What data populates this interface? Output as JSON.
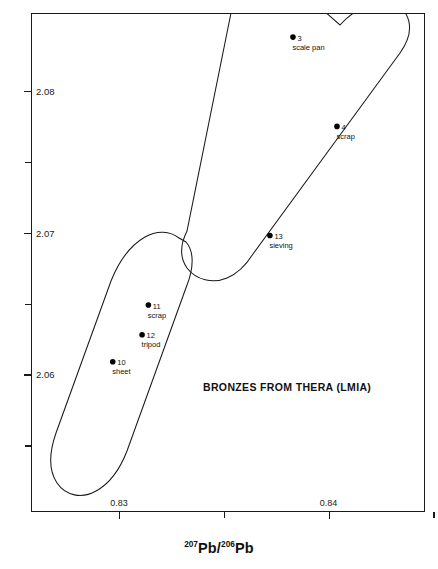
{
  "chart_data": {
    "type": "scatter",
    "title": "",
    "annotation": "BRONZES FROM THERA (LMIA)",
    "xlabel_parts": {
      "sup1": "207",
      "mid": "Pb/",
      "sup2": "206",
      "end": "Pb"
    },
    "ylabel_parts": {
      "sup1": "208",
      "mid": "Pb/",
      "sup2": "206",
      "end": "Pb"
    },
    "xlabel": "207Pb/206Pb",
    "ylabel": "208Pb/206Pb",
    "xlim": [
      0.8258,
      0.8446
    ],
    "ylim": [
      2.0503,
      2.0855
    ],
    "grid": false,
    "legend": "none",
    "x_ticks_major": [
      {
        "value": 0.83,
        "label": "0.83"
      },
      {
        "value": 0.84,
        "label": "0.84"
      }
    ],
    "x_ticks_minor": [
      0.835,
      0.845
    ],
    "y_ticks_major": [
      {
        "value": 2.08,
        "label": "2.08"
      },
      {
        "value": 2.07,
        "label": "2.07"
      },
      {
        "value": 2.06,
        "label": "2.06"
      }
    ],
    "y_ticks_minor": [
      2.075,
      2.065,
      2.055
    ],
    "points": [
      {
        "id": "3",
        "desc": "scale pan",
        "x": 0.8383,
        "y": 2.0838
      },
      {
        "id": "4",
        "desc": "scrap",
        "x": 0.8404,
        "y": 2.0775
      },
      {
        "id": "13",
        "desc": "sieving",
        "x": 0.8372,
        "y": 2.0698
      },
      {
        "id": "11",
        "desc": "scrap",
        "x": 0.8314,
        "y": 2.0649
      },
      {
        "id": "12",
        "desc": "tripod",
        "x": 0.8311,
        "y": 2.0628
      },
      {
        "id": "10",
        "desc": "sheet",
        "x": 0.8297,
        "y": 2.0609
      }
    ],
    "fields": [
      {
        "name": "upper-field",
        "label": "upper ore field outline"
      },
      {
        "name": "lower-field",
        "label": "lower ore field outline"
      }
    ]
  }
}
